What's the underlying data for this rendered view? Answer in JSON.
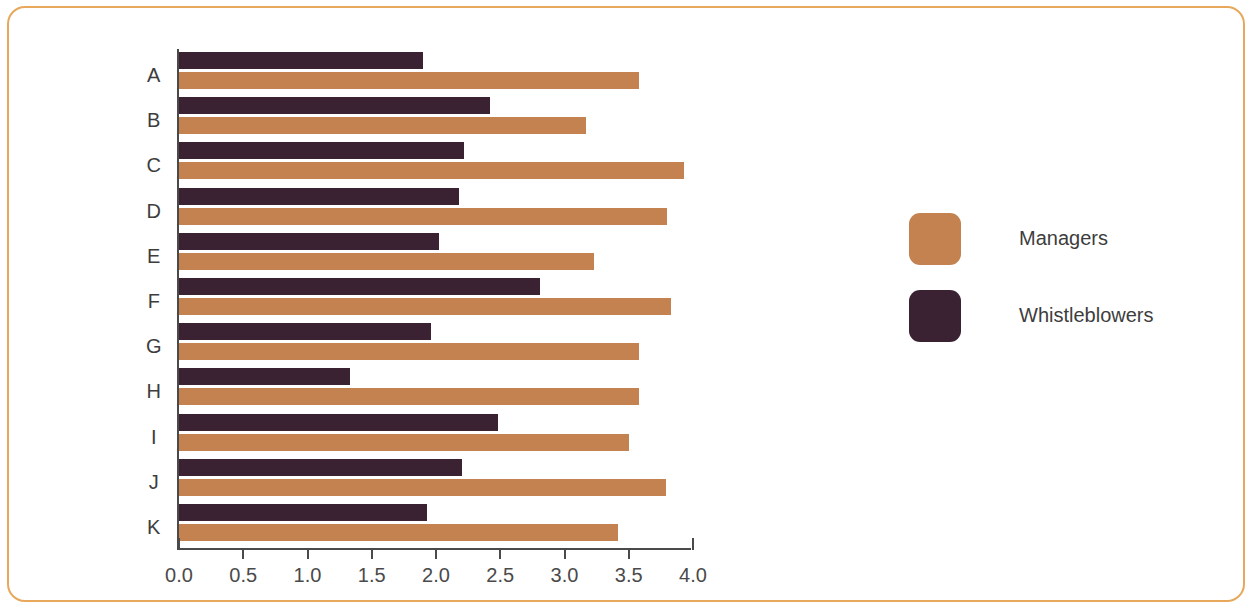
{
  "chart_data": {
    "type": "bar",
    "orientation": "horizontal",
    "title": "",
    "xlabel": "",
    "ylabel": "",
    "xlim": [
      0.0,
      4.0
    ],
    "xticks": [
      "0.0",
      "0.5",
      "1.0",
      "1.5",
      "2.0",
      "2.5",
      "3.0",
      "3.5",
      "4.0"
    ],
    "grid": false,
    "legend_position": "right",
    "categories": [
      "A",
      "B",
      "C",
      "D",
      "E",
      "F",
      "G",
      "H",
      "I",
      "J",
      "K"
    ],
    "series": [
      {
        "name": "Managers",
        "color": "#c3824f",
        "values": [
          3.58,
          3.17,
          3.93,
          3.8,
          3.23,
          3.83,
          3.58,
          3.58,
          3.5,
          3.79,
          3.42
        ]
      },
      {
        "name": "Whistleblowers",
        "color": "#3a2233",
        "values": [
          1.9,
          2.42,
          2.22,
          2.18,
          2.02,
          2.81,
          1.96,
          1.33,
          2.48,
          2.2,
          1.93
        ]
      }
    ]
  },
  "legend": {
    "entries": [
      {
        "label": "Managers",
        "color": "#c3824f"
      },
      {
        "label": "Whistleblowers",
        "color": "#3a2233"
      }
    ]
  },
  "frame": {
    "border_color": "#E8A85C"
  }
}
